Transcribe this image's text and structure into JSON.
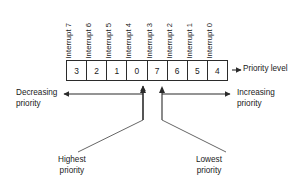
{
  "figure": {
    "register": {
      "name": "priority-register",
      "cells": [
        {
          "interrupt_label": "Interrupt 7",
          "value": "3"
        },
        {
          "interrupt_label": "Interrupt 6",
          "value": "2"
        },
        {
          "interrupt_label": "Interrupt 5",
          "value": "1"
        },
        {
          "interrupt_label": "Interrupt 4",
          "value": "0"
        },
        {
          "interrupt_label": "Interrupt 3",
          "value": "7"
        },
        {
          "interrupt_label": "Interrupt 2",
          "value": "6"
        },
        {
          "interrupt_label": "Interrupt 1",
          "value": "5"
        },
        {
          "interrupt_label": "Interrupt 0",
          "value": "4"
        }
      ]
    },
    "annotations": {
      "priority_level": "Priority level",
      "decreasing_priority_line1": "Decreasing",
      "decreasing_priority_line2": "priority",
      "increasing_priority_line1": "Increasing",
      "increasing_priority_line2": "priority",
      "highest_priority_line1": "Highest",
      "highest_priority_line2": "priority",
      "lowest_priority_line1": "Lowest",
      "lowest_priority_line2": "priority"
    },
    "colors": {
      "ink": "#1a1a1a",
      "rule": "#2b2b2b",
      "background": "#ffffff"
    }
  }
}
